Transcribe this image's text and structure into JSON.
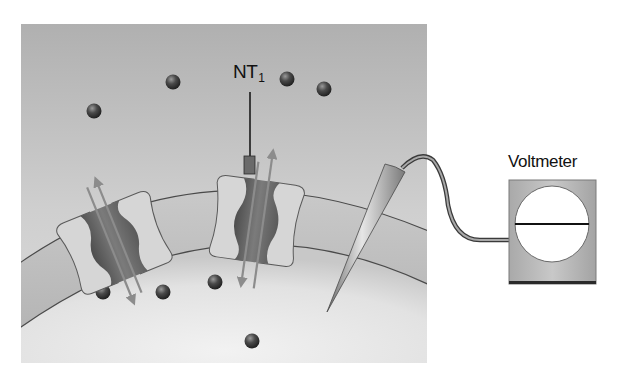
{
  "figure": {
    "type": "diagram",
    "labels": {
      "neurotransmitter": "NT",
      "neurotransmitter_subscript": "1",
      "voltmeter": "Voltmeter"
    },
    "colors": {
      "background_outside": "#b9b9b9",
      "cytoplasm": "#e4e4e4",
      "membrane": "#c2c2c2",
      "membrane_outline": "#4a4a4a",
      "channel_subunit_light": "#d8d8d8",
      "channel_subunit_dark": "#5e5e5e",
      "channel_pore": "#8a8a8a",
      "arrow": "#8c8c8c",
      "ion": "#3d3d3d",
      "voltmeter_body": "#bdbdbd",
      "voltmeter_face": "#ffffff",
      "electrode": "#9a9a9a"
    },
    "components": {
      "channels": [
        {
          "id": "channel-1",
          "state": "open",
          "ligand_bound": false,
          "flow": "bidirectional"
        },
        {
          "id": "channel-2",
          "state": "open",
          "ligand_bound": true,
          "ligand": "NT1",
          "flow": "bidirectional"
        }
      ],
      "ions_outside": 4,
      "ions_inside": 4,
      "electrode": "intracellular recording microelectrode",
      "meter": "voltmeter with horizontal needle"
    }
  }
}
